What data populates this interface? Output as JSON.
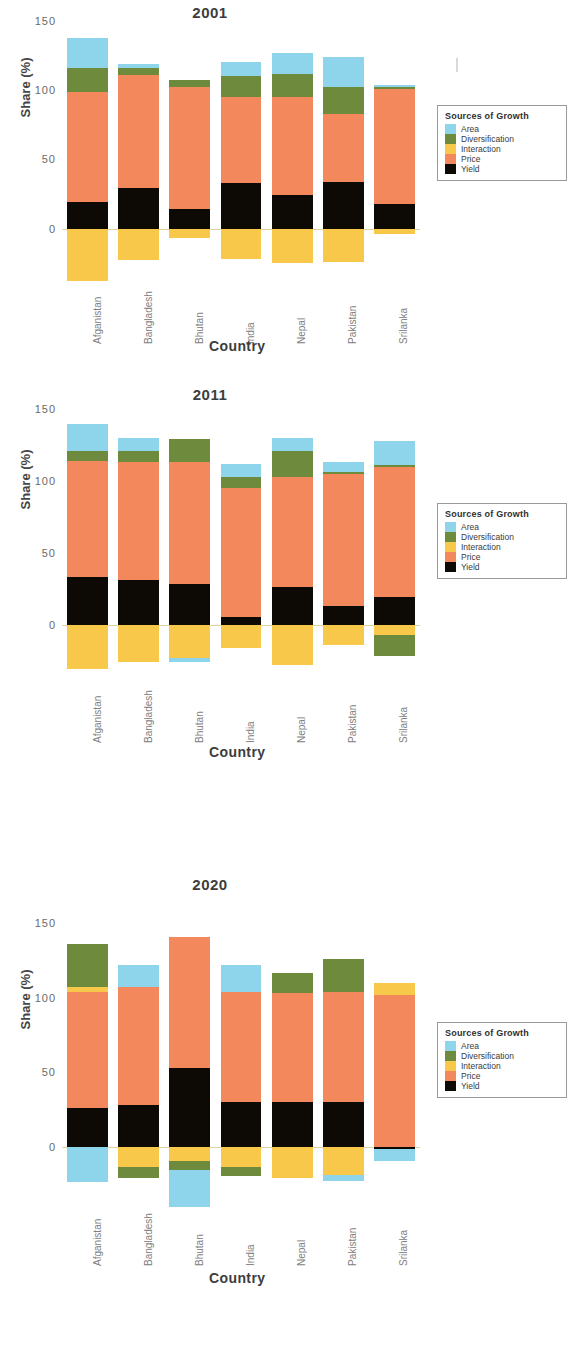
{
  "figure": {
    "y_axis_label": "Share (%)",
    "x_axis_label": "Country",
    "y_ticks": [
      "0",
      "50",
      "100",
      "150"
    ],
    "countries": [
      "Afganistan",
      "Bangladesh",
      "Bhutan",
      "India",
      "Nepal",
      "Pakistan",
      "Srilanka"
    ],
    "legend": {
      "title": "Sources of Growth",
      "items": [
        {
          "label": "Area",
          "color": "#8ed4ea"
        },
        {
          "label": "Diversification",
          "color": "#6e8b3d"
        },
        {
          "label": "Interaction",
          "color": "#f8c84a"
        },
        {
          "label": "Price",
          "color": "#f2885c"
        },
        {
          "label": "Yield",
          "color": "#0d0a06"
        }
      ]
    }
  },
  "chart_data": [
    {
      "type": "bar",
      "title": "2001",
      "xlabel": "Country",
      "ylabel": "Share (%)",
      "ylim": [
        -40,
        155
      ],
      "yticks": [
        0,
        50,
        100,
        150
      ],
      "grid": false,
      "legend_position": "right",
      "stacked": true,
      "categories": [
        "Afganistan",
        "Bangladesh",
        "Bhutan",
        "India",
        "Nepal",
        "Pakistan",
        "Srilanka"
      ],
      "series": [
        {
          "name": "Yield",
          "color": "#0d0a06",
          "values": [
            19,
            29,
            14,
            33,
            24,
            34,
            18
          ]
        },
        {
          "name": "Price",
          "color": "#f2885c",
          "values": [
            80,
            82,
            88,
            62,
            71,
            49,
            83
          ]
        },
        {
          "name": "Diversification",
          "color": "#6e8b3d",
          "values": [
            17,
            5,
            5,
            15,
            17,
            19,
            1
          ]
        },
        {
          "name": "Area",
          "color": "#8ed4ea",
          "values": [
            22,
            3,
            0,
            10,
            15,
            22,
            2
          ]
        },
        {
          "name": "Interaction",
          "color": "#f8c84a",
          "values": [
            -38,
            -23,
            -7,
            -22,
            -25,
            -24,
            -4
          ]
        }
      ]
    },
    {
      "type": "bar",
      "title": "2011",
      "xlabel": "Country",
      "ylabel": "Share (%)",
      "ylim": [
        -40,
        155
      ],
      "yticks": [
        0,
        50,
        100,
        150
      ],
      "grid": false,
      "legend_position": "right",
      "stacked": true,
      "categories": [
        "Afganistan",
        "Bangladesh",
        "Bhutan",
        "India",
        "Nepal",
        "Pakistan",
        "Srilanka"
      ],
      "series": [
        {
          "name": "Yield",
          "color": "#0d0a06",
          "values": [
            33,
            31,
            28,
            5,
            26,
            13,
            19
          ]
        },
        {
          "name": "Price",
          "color": "#f2885c",
          "values": [
            81,
            82,
            85,
            90,
            77,
            92,
            91
          ]
        },
        {
          "name": "Diversification",
          "color": "#6e8b3d",
          "values": [
            7,
            8,
            16,
            8,
            18,
            1,
            1
          ]
        },
        {
          "name": "Area",
          "color": "#8ed4ea",
          "values": [
            19,
            9,
            0,
            9,
            9,
            7,
            17
          ]
        },
        {
          "name": "Interaction",
          "color": "#f8c84a",
          "values": [
            -31,
            -26,
            -23,
            -16,
            -28,
            -14,
            -7
          ]
        },
        {
          "name": "Diversification(neg)",
          "color": "#6e8b3d",
          "values": [
            0,
            0,
            0,
            0,
            0,
            0,
            -15
          ]
        },
        {
          "name": "Area(neg)",
          "color": "#8ed4ea",
          "values": [
            0,
            0,
            -3,
            0,
            0,
            0,
            0
          ]
        }
      ]
    },
    {
      "type": "bar",
      "title": "2020",
      "xlabel": "Country",
      "ylabel": "Share (%)",
      "ylim": [
        -40,
        155
      ],
      "yticks": [
        0,
        50,
        100,
        150
      ],
      "grid": false,
      "legend_position": "right",
      "stacked": true,
      "categories": [
        "Afganistan",
        "Bangladesh",
        "Bhutan",
        "India",
        "Nepal",
        "Pakistan",
        "Srilanka"
      ],
      "series": [
        {
          "name": "Yield",
          "color": "#0d0a06",
          "values": [
            26,
            28,
            53,
            30,
            30,
            30,
            -2
          ]
        },
        {
          "name": "Price",
          "color": "#f2885c",
          "values": [
            78,
            79,
            88,
            74,
            73,
            74,
            102
          ]
        },
        {
          "name": "Interaction(pos)",
          "color": "#f8c84a",
          "values": [
            3,
            0,
            0,
            0,
            0,
            0,
            8
          ]
        },
        {
          "name": "Diversification",
          "color": "#6e8b3d",
          "values": [
            29,
            0,
            0,
            0,
            14,
            22,
            0
          ]
        },
        {
          "name": "Area",
          "color": "#8ed4ea",
          "values": [
            0,
            15,
            0,
            18,
            0,
            0,
            0
          ]
        },
        {
          "name": "Interaction",
          "color": "#f8c84a",
          "values": [
            0,
            -14,
            -10,
            -14,
            -21,
            -19,
            0
          ]
        },
        {
          "name": "Diversification(neg)",
          "color": "#6e8b3d",
          "values": [
            0,
            -7,
            -6,
            -6,
            0,
            0,
            0
          ]
        },
        {
          "name": "Area(neg)",
          "color": "#8ed4ea",
          "values": [
            -24,
            0,
            -25,
            0,
            0,
            -4,
            -8
          ]
        }
      ]
    }
  ]
}
